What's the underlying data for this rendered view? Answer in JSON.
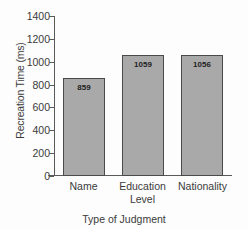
{
  "chart_data": {
    "type": "bar",
    "title": "",
    "categories": [
      "Name",
      "Education Level",
      "Nationality"
    ],
    "category_lines": [
      [
        "Name"
      ],
      [
        "Education",
        "Level"
      ],
      [
        "Nationality"
      ]
    ],
    "values": [
      859,
      1059,
      1056
    ],
    "value_labels": [
      "859",
      "1059",
      "1056"
    ],
    "xlabel": "Type of Judgment",
    "ylabel": "Recreation Time (ms)",
    "ylim": [
      0,
      1400
    ],
    "yticks": [
      1400,
      1200,
      1000,
      800,
      600,
      400,
      200,
      0
    ],
    "ytick_labels": [
      "1400",
      "1200",
      "1000",
      "800",
      "600",
      "400",
      "200",
      "0"
    ],
    "grid": false,
    "legend": null,
    "bar_color": "#a9a9a9",
    "bar_edge_color": "#4a4a4a",
    "axis_color": "#5a5a5a",
    "background": "#fdfdfd"
  }
}
